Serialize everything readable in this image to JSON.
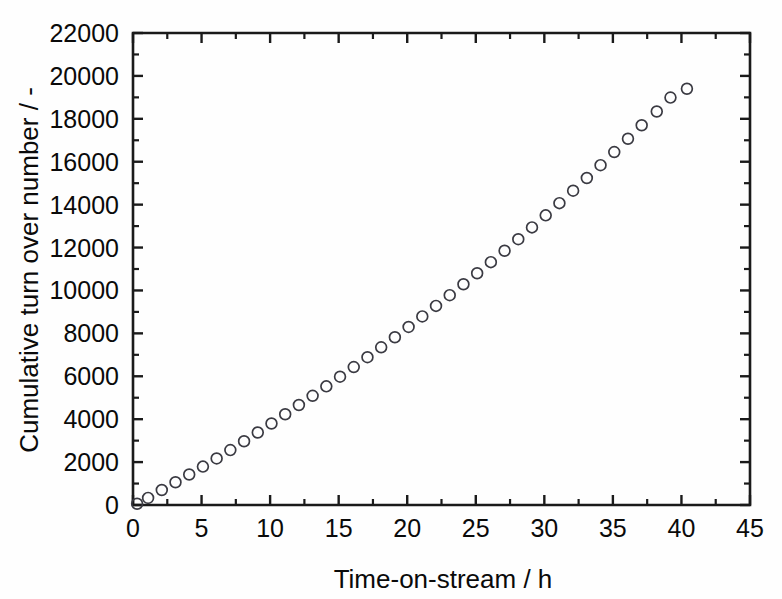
{
  "chart_data": {
    "type": "scatter",
    "title": "",
    "xlabel": "Time-on-stream / h",
    "ylabel": "Cumulative turn over number / -",
    "xlim": [
      0,
      45
    ],
    "ylim": [
      0,
      22000
    ],
    "grid": false,
    "legend": null,
    "x_ticks": [
      0,
      5,
      10,
      15,
      20,
      25,
      30,
      35,
      40,
      45
    ],
    "x_tick_labels": [
      "0",
      "5",
      "10",
      "15",
      "20",
      "25",
      "30",
      "35",
      "40",
      "45"
    ],
    "x_minor_interval": 2.5,
    "y_ticks": [
      0,
      2000,
      4000,
      6000,
      8000,
      10000,
      12000,
      14000,
      16000,
      18000,
      20000,
      22000
    ],
    "y_tick_labels": [
      "0",
      "2000",
      "4000",
      "6000",
      "8000",
      "10000",
      "12000",
      "14000",
      "16000",
      "18000",
      "20000",
      "22000"
    ],
    "y_minor_interval": 1000,
    "marker_style": "open-circle",
    "marker_color": "#3a3a42",
    "series": [
      {
        "name": "Cumulative turn over number",
        "x": [
          0.3,
          1.1,
          2.1,
          3.1,
          4.1,
          5.1,
          6.1,
          7.1,
          8.1,
          9.1,
          10.1,
          11.1,
          12.1,
          13.1,
          14.1,
          15.1,
          16.1,
          17.1,
          18.1,
          19.1,
          20.1,
          21.1,
          22.1,
          23.1,
          24.1,
          25.1,
          26.1,
          27.1,
          28.1,
          29.1,
          30.1,
          31.1,
          32.1,
          33.1,
          34.1,
          35.1,
          36.1,
          37.1,
          38.2,
          39.2,
          40.4
        ],
        "y": [
          60,
          330,
          700,
          1060,
          1420,
          1790,
          2170,
          2560,
          2970,
          3380,
          3800,
          4230,
          4660,
          5090,
          5530,
          5980,
          6430,
          6890,
          7350,
          7820,
          8300,
          8790,
          9280,
          9780,
          10290,
          10800,
          11320,
          11850,
          12390,
          12940,
          13500,
          14070,
          14650,
          15240,
          15840,
          16450,
          17070,
          17700,
          18340,
          18990,
          19400
        ]
      }
    ]
  }
}
